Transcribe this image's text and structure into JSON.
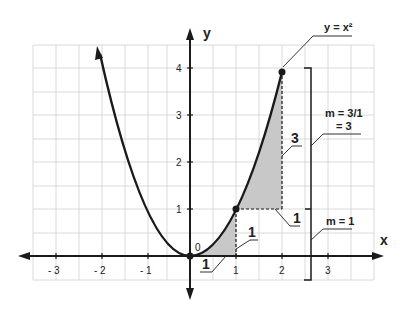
{
  "diagram": {
    "curve_label": "y = x²",
    "axis_x_label": "x",
    "axis_y_label": "y",
    "origin_label": "0",
    "x_ticks": [
      "- 3",
      "- 2",
      "- 1",
      "1",
      "2",
      "3"
    ],
    "y_ticks": [
      "1",
      "2",
      "3",
      "4"
    ],
    "small_triangle": {
      "run_label": "1",
      "rise_label": "1"
    },
    "large_triangle": {
      "run_label": "1",
      "rise_label": "3"
    },
    "slope_small": "m = 1",
    "slope_large_line1": "m = 3/1",
    "slope_large_line2": "= 3",
    "colors": {
      "grid": "#cfcfcf",
      "curve": "#1a1a1a",
      "shade": "#c8c8c8",
      "axis": "#1a1a1a"
    }
  }
}
